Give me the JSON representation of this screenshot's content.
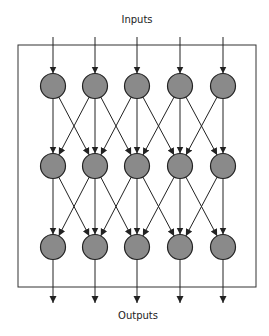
{
  "diagram": {
    "input_label": "Inputs",
    "output_label": "Outputs",
    "colors": {
      "node_fill": "#8a8a8a",
      "stroke": "#222222"
    },
    "layout": {
      "columns_x": [
        53,
        95,
        137,
        180,
        223
      ],
      "rows_y": [
        86,
        166,
        247
      ],
      "node_radius": 12.5,
      "frame": {
        "x1": 18,
        "y1": 45,
        "x2": 256,
        "y2": 287
      },
      "input_start_y": 37,
      "output_end_y": 303
    },
    "network": {
      "layers": 3,
      "nodes_per_layer": 5,
      "connectivity": "each node connects to the node directly below and its immediate left/right neighbors in the next layer"
    }
  }
}
